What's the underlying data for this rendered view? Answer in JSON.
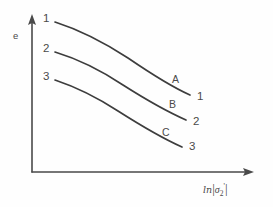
{
  "figure": {
    "background_color": "#fefefe",
    "ink_color": "#4a4a4a"
  },
  "axes": {
    "y_label": "e",
    "x_label_prefix": "ln",
    "x_label_open_bar": "|",
    "x_label_sigma": "σ",
    "x_label_subscript": "2",
    "x_label_prime": "'",
    "x_label_close_bar": "|",
    "x_label_plain": "ln |σ₂'|"
  },
  "curve_start_labels": [
    {
      "text": "1"
    },
    {
      "text": "2"
    },
    {
      "text": "3"
    }
  ],
  "curve_end_labels": [
    {
      "text": "1"
    },
    {
      "text": "2"
    },
    {
      "text": "3"
    }
  ],
  "curve_mid_labels": [
    {
      "text": "A"
    },
    {
      "text": "B"
    },
    {
      "text": "C"
    }
  ],
  "chart_data": {
    "type": "line",
    "title": "",
    "xlabel": "ln |σ₂'|",
    "ylabel": "e",
    "grid": false,
    "legend": "none",
    "axis_style": "arrowed-schematic",
    "xlim": [
      0,
      1
    ],
    "ylim": [
      0,
      1
    ],
    "annotations": [
      {
        "text": "1",
        "role": "curve-start-label",
        "curve": "A",
        "x_px": 45,
        "y_px": 20
      },
      {
        "text": "2",
        "role": "curve-start-label",
        "curve": "B",
        "x_px": 45,
        "y_px": 49
      },
      {
        "text": "3",
        "role": "curve-start-label",
        "curve": "C",
        "x_px": 45,
        "y_px": 77
      },
      {
        "text": "A",
        "role": "curve-name-label",
        "curve": "A",
        "x_px": 176,
        "y_px": 80
      },
      {
        "text": "B",
        "role": "curve-name-label",
        "curve": "B",
        "x_px": 172,
        "y_px": 105
      },
      {
        "text": "C",
        "role": "curve-name-label",
        "curve": "C",
        "x_px": 165,
        "y_px": 133
      },
      {
        "text": "1",
        "role": "curve-end-label",
        "curve": "A",
        "x_px": 198,
        "y_px": 95
      },
      {
        "text": "2",
        "role": "curve-end-label",
        "curve": "B",
        "x_px": 194,
        "y_px": 120
      },
      {
        "text": "3",
        "role": "curve-end-label",
        "curve": "C",
        "x_px": 190,
        "y_px": 145
      }
    ],
    "series": [
      {
        "name": "A",
        "start_label": "1",
        "end_label": "3",
        "x": [
          0.11,
          0.22,
          0.33,
          0.44,
          0.55,
          0.66,
          0.77
        ],
        "values": [
          0.97,
          0.9,
          0.83,
          0.76,
          0.7,
          0.65,
          0.61
        ],
        "path_px": "M 55,22 C 80,30 105,43 128,58 C 150,73 172,87 190,95"
      },
      {
        "name": "B",
        "start_label": "2",
        "end_label": "2",
        "x": [
          0.11,
          0.22,
          0.33,
          0.44,
          0.55,
          0.66,
          0.77
        ],
        "values": [
          0.79,
          0.72,
          0.65,
          0.59,
          0.53,
          0.48,
          0.44
        ],
        "path_px": "M 55,52 C 78,59 102,71 123,85 C 145,99 168,112 186,120"
      },
      {
        "name": "C",
        "start_label": "3",
        "end_label": "3",
        "x": [
          0.11,
          0.22,
          0.33,
          0.44,
          0.55,
          0.66,
          0.77
        ],
        "values": [
          0.61,
          0.54,
          0.48,
          0.42,
          0.37,
          0.32,
          0.29
        ],
        "path_px": "M 55,80 C 76,87 98,98 118,111 C 140,125 164,139 182,147"
      }
    ]
  }
}
